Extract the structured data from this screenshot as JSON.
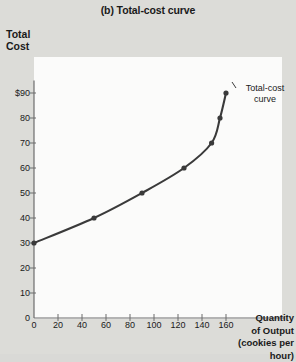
{
  "title": "(b) Total-cost curve",
  "axis": {
    "y_label_line1": "Total",
    "y_label_line2": "Cost",
    "x_label_line1": "Quantity",
    "x_label_line2": "of Output",
    "x_label_line3": "(cookies per hour)"
  },
  "annotation": {
    "line1": "Total-cost",
    "line2": "curve"
  },
  "colors": {
    "curve": "#3a3a3a",
    "axis": "#6d6d6d",
    "text": "#1a1a1a",
    "plot_bg": "#fbfbfa",
    "page_bg": "#dcdcd8"
  },
  "chart_data": {
    "type": "line",
    "title": "(b) Total-cost curve",
    "xlabel": "Quantity of Output (cookies per hour)",
    "ylabel": "Total Cost",
    "xlim": [
      0,
      170
    ],
    "ylim": [
      0,
      95
    ],
    "grid": false,
    "legend": "none",
    "markers": true,
    "series": [
      {
        "name": "Total-cost curve",
        "points": [
          {
            "x": 0,
            "y": 30
          },
          {
            "x": 50,
            "y": 40
          },
          {
            "x": 90,
            "y": 50
          },
          {
            "x": 125,
            "y": 60
          },
          {
            "x": 148,
            "y": 70
          },
          {
            "x": 155,
            "y": 80
          },
          {
            "x": 160,
            "y": 90
          }
        ]
      }
    ],
    "yticks": [
      {
        "value": 90,
        "label": "$90"
      },
      {
        "value": 80,
        "label": "80"
      },
      {
        "value": 70,
        "label": "70"
      },
      {
        "value": 60,
        "label": "60"
      },
      {
        "value": 50,
        "label": "50"
      },
      {
        "value": 40,
        "label": "40"
      },
      {
        "value": 30,
        "label": "30"
      },
      {
        "value": 20,
        "label": "20"
      },
      {
        "value": 10,
        "label": "10"
      },
      {
        "value": 0,
        "label": "0"
      }
    ],
    "xticks": [
      {
        "value": 0,
        "label": "0"
      },
      {
        "value": 20,
        "label": "20"
      },
      {
        "value": 40,
        "label": "40"
      },
      {
        "value": 60,
        "label": "60"
      },
      {
        "value": 80,
        "label": "80"
      },
      {
        "value": 100,
        "label": "100"
      },
      {
        "value": 120,
        "label": "120"
      },
      {
        "value": 140,
        "label": "140"
      },
      {
        "value": 160,
        "label": "160"
      }
    ]
  }
}
